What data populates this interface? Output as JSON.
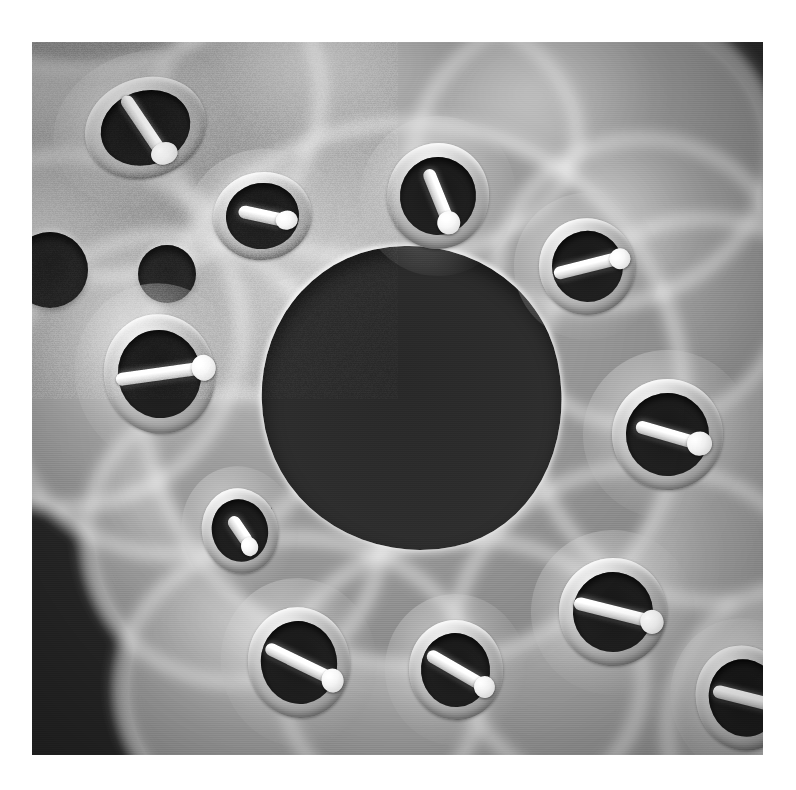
{
  "image": {
    "kind": "sem-micrograph",
    "subject": "Bryozoan colony skeleton (fenestrate cheilostome) viewed by scanning electron microscopy",
    "orientation": "frontal surface of colony",
    "alt_text": "Black and white scanning electron micrograph of a porous calcified bryozoan colony showing oval zooid apertures, bright white avicularian mandibles crossing each aperture, rings of radiating spines, and large dark fenestrae between the branches.",
    "color_mode": "grayscale",
    "border": {
      "color": "#ffffff",
      "left": 32,
      "top": 42,
      "right": 33,
      "bottom": 35
    },
    "plate": {
      "width": 731,
      "height": 713
    }
  },
  "palette": {
    "paper_white": "#ffffff",
    "highlight_white": "#ffffff",
    "skeleton_light": "#c9c9c9",
    "skeleton_mid": "#9d9d9d",
    "skeleton_dark": "#848484",
    "aperture_black": "#1d1d1d",
    "background_black": "#2e2e2e",
    "spine_dark": "#2a2a2a"
  },
  "features": {
    "fenestrae": [
      {
        "name": "central-fenestra",
        "cx": 52,
        "cy": 50,
        "rx": 20.5,
        "ry": 21.5,
        "rot": -12
      }
    ],
    "plain_pores": [
      {
        "name": "pore-upper-left-small",
        "cx": 18.5,
        "cy": 32.5,
        "r": 4.0
      },
      {
        "name": "pore-left-edge",
        "cx": 2.5,
        "cy": 32.0,
        "r": 5.2
      }
    ],
    "zooids": [
      {
        "name": "zooid-top-left",
        "cx": 15.5,
        "cy": 12.0,
        "rx": 8.4,
        "ry": 7.0,
        "rot": -18,
        "bar": 74,
        "barlen": 62,
        "spines": 0
      },
      {
        "name": "zooid-upper-mid-left",
        "cx": 31.5,
        "cy": 24.5,
        "rx": 6.8,
        "ry": 6.2,
        "rot": -8,
        "bar": 20,
        "barlen": 50,
        "spines": 26
      },
      {
        "name": "zooid-top-center",
        "cx": 55.5,
        "cy": 21.5,
        "rx": 7.0,
        "ry": 7.4,
        "rot": 6,
        "bar": 62,
        "barlen": 56,
        "spines": 24
      },
      {
        "name": "zooid-upper-right",
        "cx": 76.0,
        "cy": 31.5,
        "rx": 6.6,
        "ry": 6.8,
        "rot": -22,
        "bar": 8,
        "barlen": 70,
        "spines": 28
      },
      {
        "name": "zooid-mid-left",
        "cx": 17.5,
        "cy": 46.5,
        "rx": 7.6,
        "ry": 8.4,
        "rot": -12,
        "bar": 4,
        "barlen": 80,
        "spines": 26
      },
      {
        "name": "zooid-mid-right",
        "cx": 87.0,
        "cy": 55.0,
        "rx": 7.6,
        "ry": 7.8,
        "rot": -10,
        "bar": 26,
        "barlen": 60,
        "spines": 30
      },
      {
        "name": "zooid-center-lower",
        "cx": 28.5,
        "cy": 68.5,
        "rx": 5.2,
        "ry": 6.0,
        "rot": -14,
        "bar": 70,
        "barlen": 44,
        "spines": 12
      },
      {
        "name": "zooid-bottom-left",
        "cx": 36.5,
        "cy": 87.0,
        "rx": 7.0,
        "ry": 7.8,
        "rot": -10,
        "bar": 36,
        "barlen": 72,
        "spines": 30
      },
      {
        "name": "zooid-bottom-center",
        "cx": 58.0,
        "cy": 88.0,
        "rx": 6.4,
        "ry": 7.0,
        "rot": -6,
        "bar": 36,
        "barlen": 70,
        "spines": 26
      },
      {
        "name": "zooid-bottom-right",
        "cx": 79.5,
        "cy": 80.0,
        "rx": 7.4,
        "ry": 7.6,
        "rot": -14,
        "bar": 28,
        "barlen": 74,
        "spines": 30
      },
      {
        "name": "zooid-right-edge",
        "cx": 97.5,
        "cy": 92.0,
        "rx": 6.6,
        "ry": 7.4,
        "rot": -16,
        "bar": 30,
        "barlen": 66,
        "spines": 20
      }
    ],
    "skeleton_lobes": [
      {
        "name": "lobe-upper-left",
        "cx": 16,
        "cy": 14,
        "rx": 25,
        "ry": 21,
        "rot": -14
      },
      {
        "name": "lobe-upper-center",
        "cx": 46,
        "cy": 16,
        "rx": 26,
        "ry": 17,
        "rot": 6
      },
      {
        "name": "lobe-upper-right",
        "cx": 74,
        "cy": 20,
        "rx": 22,
        "ry": 19,
        "rot": -8
      },
      {
        "name": "lobe-left",
        "cx": 10,
        "cy": 42,
        "rx": 21,
        "ry": 22,
        "rot": 0
      },
      {
        "name": "lobe-left-mid",
        "cx": 22,
        "cy": 50,
        "rx": 20,
        "ry": 20,
        "rot": 0
      },
      {
        "name": "lobe-right",
        "cx": 88,
        "cy": 52,
        "rx": 22,
        "ry": 24,
        "rot": -6
      },
      {
        "name": "lobe-right-upper",
        "cx": 80,
        "cy": 36,
        "rx": 18,
        "ry": 18,
        "rot": 0
      },
      {
        "name": "lobe-center-left",
        "cx": 30,
        "cy": 68,
        "rx": 18,
        "ry": 18,
        "rot": 0
      },
      {
        "name": "lobe-bottom-left",
        "cx": 38,
        "cy": 87,
        "rx": 22,
        "ry": 19,
        "rot": 4
      },
      {
        "name": "lobe-bottom-center",
        "cx": 58,
        "cy": 86,
        "rx": 22,
        "ry": 18,
        "rot": -2
      },
      {
        "name": "lobe-bottom-right",
        "cx": 80,
        "cy": 80,
        "rx": 23,
        "ry": 21,
        "rot": -8
      },
      {
        "name": "lobe-right-edge",
        "cx": 99,
        "cy": 92,
        "rx": 16,
        "ry": 18,
        "rot": 0
      },
      {
        "name": "lobe-bridge-center",
        "cx": 52,
        "cy": 50,
        "rx": 33,
        "ry": 34,
        "rot": -12
      },
      {
        "name": "lobe-top-strip",
        "cx": 14,
        "cy": 2,
        "rx": 16,
        "ry": 7,
        "rot": -6
      }
    ]
  }
}
